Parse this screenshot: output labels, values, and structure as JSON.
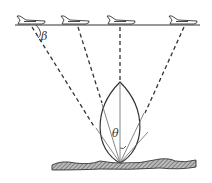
{
  "diagram": {
    "labels": {
      "beta": "β",
      "theta": "θ"
    },
    "aircraft_count": 4,
    "colors": {
      "line": "#333333",
      "ground": "#777777"
    }
  }
}
